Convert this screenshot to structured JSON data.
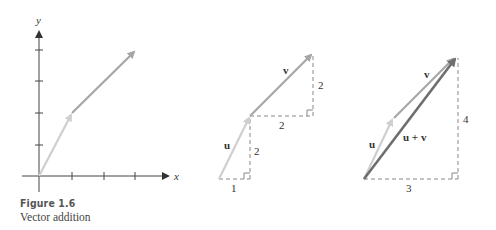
{
  "caption": {
    "title": "Figure 1.6",
    "subtitle": "Vector addition"
  },
  "panel1": {
    "x_axis_label": "x",
    "y_axis_label": "y"
  },
  "panel2": {
    "u_label": "u",
    "v_label": "v",
    "u_dx": "1",
    "u_dy": "2",
    "v_dx": "2",
    "v_dy": "2"
  },
  "panel3": {
    "u_label": "u",
    "v_label": "v",
    "sum_label": "u + v",
    "sum_dx": "3",
    "sum_dy": "4"
  },
  "colors": {
    "u": "#cfcfcf",
    "v": "#a6a6a6",
    "sum": "#6e6e6e",
    "axis": "#444444",
    "dash": "#888888"
  }
}
